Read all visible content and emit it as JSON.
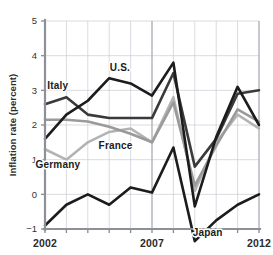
{
  "chart_data": {
    "type": "line",
    "title": "",
    "xlabel": "",
    "ylabel": "Inflation rate (percent)",
    "xlim": [
      2002,
      2012
    ],
    "ylim": [
      -1,
      5
    ],
    "grid": true,
    "legend_position": "inline-annotations",
    "x": [
      2002,
      2003,
      2004,
      2005,
      2006,
      2007,
      2008,
      2009,
      2010,
      2011,
      2012
    ],
    "xtick_labels": [
      "2002",
      "",
      "",
      "",
      "",
      "2007",
      "",
      "",
      "",
      "",
      "2012"
    ],
    "xticks_major": [
      2002,
      2007,
      2012
    ],
    "ytick_labels": [
      "5",
      "4",
      "3",
      "2",
      "1",
      "0",
      "−1"
    ],
    "yticks": [
      5,
      4,
      3,
      2,
      1,
      0,
      -1
    ],
    "series": [
      {
        "name": "Italy",
        "color": "#3a3a3a",
        "label_x": 2002.6,
        "label_y": 3.05,
        "values": [
          2.6,
          2.8,
          2.3,
          2.2,
          2.2,
          2.2,
          3.5,
          0.8,
          1.6,
          2.9,
          3.0
        ]
      },
      {
        "name": "U.S.",
        "color": "#1c1c1c",
        "label_x": 2005.5,
        "label_y": 3.55,
        "values": [
          1.6,
          2.3,
          2.7,
          3.35,
          3.2,
          2.85,
          3.8,
          -0.35,
          1.65,
          3.1,
          2.0
        ]
      },
      {
        "name": "France",
        "color": "#b3b3b3",
        "label_x": 2005.3,
        "label_y": 1.3,
        "values": [
          1.3,
          1.0,
          1.5,
          1.8,
          1.9,
          1.5,
          2.8,
          0.1,
          1.5,
          2.3,
          1.9
        ]
      },
      {
        "name": "Germany",
        "color": "#9a9a9a",
        "label_x": 2002.6,
        "label_y": 0.75,
        "values": [
          2.15,
          2.15,
          2.1,
          1.95,
          1.75,
          1.5,
          2.65,
          0.25,
          1.4,
          2.45,
          2.1
        ]
      },
      {
        "name": "Japan",
        "color": "#1c1c1c",
        "label_x": 2009.6,
        "label_y": -1.2,
        "values": [
          -0.9,
          -0.3,
          0.0,
          -0.3,
          0.2,
          0.05,
          1.35,
          -1.35,
          -0.75,
          -0.3,
          0.0
        ]
      }
    ]
  }
}
